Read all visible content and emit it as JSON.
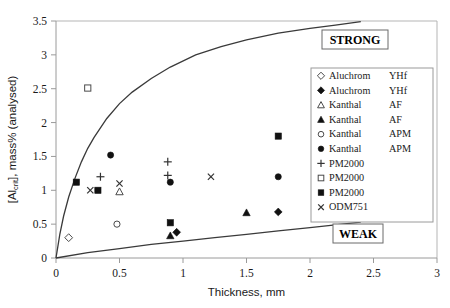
{
  "chart_data": {
    "type": "scatter",
    "title": "",
    "xlabel": "Thickness, mm",
    "ylabel": "[Al_crit], mass% (analysed)",
    "ylabel_main": "], mass% (analysed)",
    "ylabel_prefix": "[Al",
    "ylabel_sub": "crit",
    "xlim": [
      0,
      3
    ],
    "ylim": [
      0,
      3.5
    ],
    "xticks": [
      "0",
      "0.5",
      "1",
      "1.5",
      "2",
      "2.5",
      "3"
    ],
    "xtick_values": [
      0,
      0.5,
      1,
      1.5,
      2,
      2.5,
      3
    ],
    "yticks": [
      "0",
      "0.5",
      "1",
      "1.5",
      "2",
      "2.5",
      "3",
      "3.5"
    ],
    "ytick_values": [
      0,
      0.5,
      1,
      1.5,
      2,
      2.5,
      3,
      3.5
    ],
    "grid": false,
    "legend_position": "right-inside",
    "curves": [
      {
        "name": "strong-boundary",
        "label": "STRONG",
        "points": [
          [
            0.0,
            0.0
          ],
          [
            0.03,
            0.35
          ],
          [
            0.06,
            0.62
          ],
          [
            0.1,
            0.9
          ],
          [
            0.15,
            1.18
          ],
          [
            0.2,
            1.42
          ],
          [
            0.25,
            1.62
          ],
          [
            0.3,
            1.78
          ],
          [
            0.4,
            2.06
          ],
          [
            0.5,
            2.28
          ],
          [
            0.6,
            2.45
          ],
          [
            0.75,
            2.65
          ],
          [
            0.9,
            2.82
          ],
          [
            1.1,
            3.0
          ],
          [
            1.3,
            3.12
          ],
          [
            1.5,
            3.22
          ],
          [
            1.75,
            3.32
          ],
          [
            2.0,
            3.39
          ],
          [
            2.2,
            3.44
          ],
          [
            2.4,
            3.49
          ]
        ]
      },
      {
        "name": "weak-boundary",
        "label": "WEAK",
        "points": [
          [
            0.0,
            0.0
          ],
          [
            0.25,
            0.08
          ],
          [
            0.5,
            0.14
          ],
          [
            0.75,
            0.2
          ],
          [
            1.0,
            0.25
          ],
          [
            1.25,
            0.3
          ],
          [
            1.5,
            0.35
          ],
          [
            1.75,
            0.4
          ],
          [
            2.0,
            0.45
          ],
          [
            2.2,
            0.49
          ],
          [
            2.4,
            0.53
          ]
        ]
      }
    ],
    "series": [
      {
        "name": "Aluchrom   YHf",
        "label_left": "Aluchrom",
        "label_right": "YHf",
        "marker": "diamond-open",
        "points": [
          [
            0.1,
            0.3
          ]
        ]
      },
      {
        "name": "Aluchrom   YHf (filled)",
        "label_left": "Aluchrom",
        "label_right": "YHf",
        "marker": "diamond-filled",
        "points": [
          [
            0.95,
            0.38
          ],
          [
            1.75,
            0.68
          ]
        ]
      },
      {
        "name": "Kanthal   AF",
        "label_left": "Kanthal",
        "label_right": "AF",
        "marker": "triangle-open",
        "points": [
          [
            0.5,
            0.98
          ]
        ]
      },
      {
        "name": "Kanthal   AF (filled)",
        "label_left": "Kanthal",
        "label_right": "AF",
        "marker": "triangle-filled",
        "points": [
          [
            0.9,
            0.33
          ],
          [
            1.5,
            0.67
          ]
        ]
      },
      {
        "name": "Kanthal   APM",
        "label_left": "Kanthal",
        "label_right": "APM",
        "marker": "circle-open",
        "points": [
          [
            0.48,
            0.5
          ]
        ]
      },
      {
        "name": "Kanthal   APM (filled)",
        "label_left": "Kanthal",
        "label_right": "APM",
        "marker": "circle-filled",
        "points": [
          [
            0.43,
            1.52
          ],
          [
            0.9,
            1.12
          ],
          [
            1.75,
            1.2
          ]
        ]
      },
      {
        "name": "PM2000 (plus)",
        "label_left": "PM2000",
        "label_right": "",
        "marker": "plus",
        "points": [
          [
            0.35,
            1.2
          ],
          [
            0.88,
            1.42
          ],
          [
            0.88,
            1.22
          ]
        ]
      },
      {
        "name": "PM2000 (open square)",
        "label_left": "PM2000",
        "label_right": "",
        "marker": "square-open",
        "points": [
          [
            0.25,
            2.51
          ]
        ]
      },
      {
        "name": "PM2000 (filled square)",
        "label_left": "PM2000",
        "label_right": "",
        "marker": "square-filled",
        "points": [
          [
            0.16,
            1.12
          ],
          [
            0.33,
            1.0
          ],
          [
            0.9,
            0.52
          ],
          [
            1.75,
            1.8
          ]
        ]
      },
      {
        "name": "ODM751",
        "label_left": "ODM751",
        "label_right": "",
        "marker": "cross",
        "points": [
          [
            0.27,
            1.0
          ],
          [
            0.5,
            1.1
          ],
          [
            1.22,
            1.2
          ]
        ]
      }
    ],
    "annotations": [
      {
        "name": "strong-label",
        "text": "STRONG"
      },
      {
        "name": "weak-label",
        "text": "WEAK"
      }
    ]
  }
}
